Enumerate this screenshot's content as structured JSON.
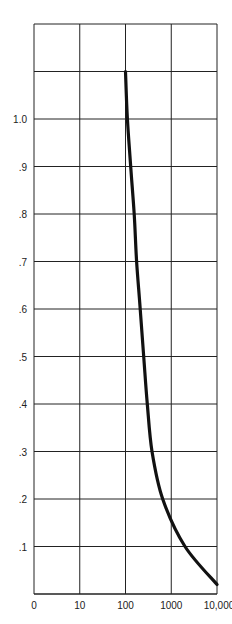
{
  "chart_data": {
    "type": "line",
    "title": "",
    "xlabel": "",
    "ylabel": "",
    "x_scale": "log-decades (0, 10, 100, 1000, 10,000 equally spaced)",
    "x_tick_labels": [
      "0",
      "10",
      "100",
      "1000",
      "10,000"
    ],
    "y_tick_labels": [
      ".1",
      ".2",
      ".3",
      ".4",
      ".5",
      ".6",
      ".7",
      ".8",
      ".9",
      "1.0"
    ],
    "ylim": [
      0,
      1.2
    ],
    "grid": true,
    "legend": null,
    "series": [
      {
        "name": "curve",
        "color": "#111111",
        "points": [
          {
            "x": 100,
            "y": 1.1
          },
          {
            "x": 110,
            "y": 1.0
          },
          {
            "x": 130,
            "y": 0.9
          },
          {
            "x": 155,
            "y": 0.8
          },
          {
            "x": 175,
            "y": 0.7
          },
          {
            "x": 210,
            "y": 0.6
          },
          {
            "x": 250,
            "y": 0.5
          },
          {
            "x": 300,
            "y": 0.4
          },
          {
            "x": 380,
            "y": 0.3
          },
          {
            "x": 650,
            "y": 0.2
          },
          {
            "x": 2000,
            "y": 0.1
          },
          {
            "x": 10000,
            "y": 0.02
          }
        ]
      }
    ]
  }
}
